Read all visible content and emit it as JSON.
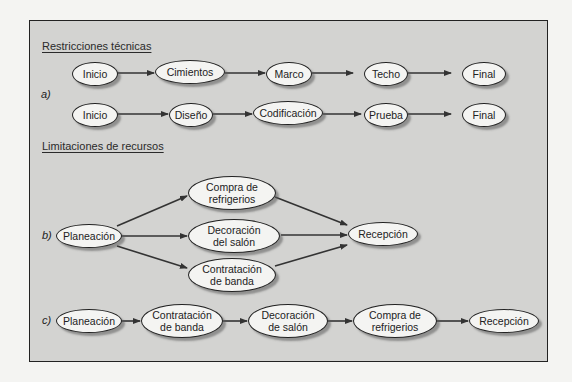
{
  "sections": {
    "technical": {
      "heading": "Restricciones técnicas"
    },
    "resources": {
      "heading": "Limitaciones de recursos"
    }
  },
  "labels": {
    "a": "a)",
    "b": "b)",
    "c": "c)"
  },
  "diagram_a": {
    "row1": [
      "Inicio",
      "Cimientos",
      "Marco",
      "Techo",
      "Final"
    ],
    "row2": [
      "Inicio",
      "Diseño",
      "Codificación",
      "Prueba",
      "Final"
    ]
  },
  "diagram_b": {
    "start": "Planeación",
    "parallel": [
      "Compra de\nrefrigerios",
      "Decoración\ndel salón",
      "Contratación\nde banda"
    ],
    "end": "Recepción"
  },
  "diagram_c": {
    "sequence": [
      "Planeación",
      "Contratación\nde banda",
      "Decoración\nde salón",
      "Compra de\nrefrigerios",
      "Recepción"
    ]
  },
  "colors": {
    "background": "#f4f4f2",
    "panel": "#d3d3d1",
    "stroke": "#222222",
    "node_fill": "#f4f4f2"
  }
}
